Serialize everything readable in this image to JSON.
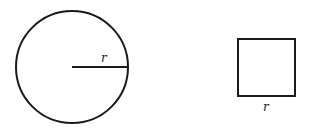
{
  "diagram": {
    "circle": {
      "label": "r",
      "description": "circle with radius r"
    },
    "square": {
      "label": "r",
      "description": "square with side r"
    }
  },
  "colors": {
    "stroke": "#1a1a1a",
    "background": "#ffffff"
  }
}
